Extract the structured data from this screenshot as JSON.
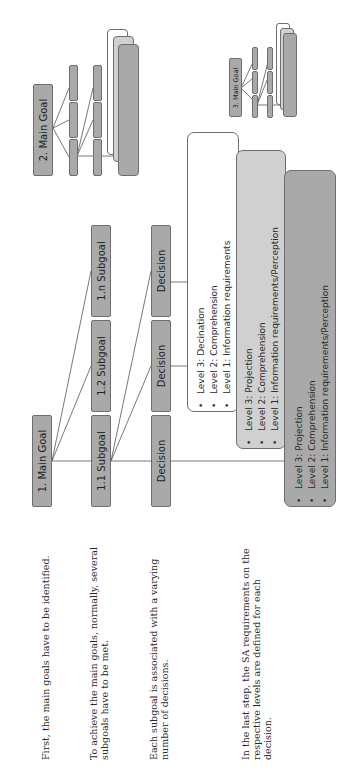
{
  "descriptions": [
    "First, the main goals have to be identified.",
    [
      "To achieve the main goals, normally, several",
      "subgoals have to be met."
    ],
    [
      "Each subgoal is associated with a varying",
      "number of decisions."
    ],
    [
      "In the last step, the SA requirements on the",
      "respective levels are defined for each",
      "decision."
    ]
  ],
  "main_goal": {
    "label": "1. Main Goal"
  },
  "subgoals": [
    {
      "label": "1.1 Subgoal"
    },
    {
      "label": "1.2 Subgoal"
    },
    {
      "label": "1.n Subgoal"
    }
  ],
  "decisions": [
    {
      "label": "Decision"
    },
    {
      "label": "Decision"
    },
    {
      "label": "Decision"
    }
  ],
  "level_boxes": [
    {
      "color": "#ffffff",
      "items": [
        "Level 3: Decination",
        "Level 2: Comprehension",
        "Level 1: Information requirements"
      ]
    },
    {
      "color": "#d0d0d0",
      "items": [
        "Level 3: Projection",
        "Level 2: Comprehension",
        "Level 1: Information requirements/Perception"
      ]
    },
    {
      "color": "#a9a9a9",
      "items": [
        "Level 3: Projection",
        "Level 2: Comprehension",
        "Level 1: Information requirements/Perception"
      ]
    }
  ],
  "mini_diagrams": [
    {
      "label": "2. Main Goal"
    },
    {
      "label": "3. Main Goal"
    }
  ],
  "colors": {
    "box_fill": "#a9a9a9",
    "box_border": "#6e6e6e",
    "light_fill": "#d0d0d0"
  }
}
